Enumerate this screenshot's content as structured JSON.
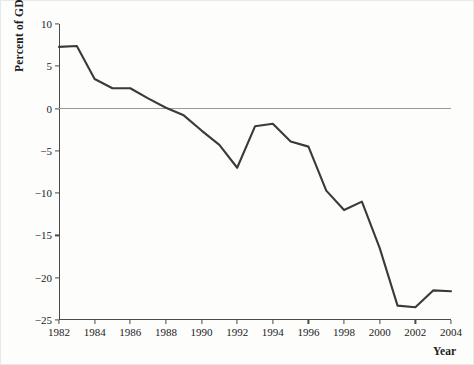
{
  "chart_data": {
    "type": "line",
    "title": "",
    "xlabel": "Year",
    "ylabel": "Percent of GDP",
    "xlim": [
      1982,
      2004
    ],
    "ylim": [
      -25,
      10
    ],
    "grid": false,
    "legend": "none",
    "zero_reference_line": true,
    "y_ticks": [
      10,
      5,
      0,
      -5,
      -10,
      -15,
      -20,
      -25
    ],
    "y_tick_labels": [
      "10",
      "5",
      "0",
      "−5",
      "−10",
      "−15",
      "−20",
      "−25"
    ],
    "x_ticks": [
      1982,
      1984,
      1986,
      1988,
      1990,
      1992,
      1994,
      1996,
      1998,
      2000,
      2002,
      2004
    ],
    "x_tick_labels": [
      "1982",
      "1984",
      "1986",
      "1988",
      "1990",
      "1992",
      "1994",
      "1996",
      "1998",
      "2000",
      "2002",
      "2004"
    ],
    "x": [
      1982,
      1983,
      1984,
      1985,
      1986,
      1987,
      1988,
      1989,
      1990,
      1991,
      1992,
      1993,
      1994,
      1995,
      1996,
      1997,
      1998,
      1999,
      2000,
      2001,
      2002,
      2003,
      2004
    ],
    "values": [
      7.3,
      7.4,
      3.5,
      2.4,
      2.4,
      1.2,
      0.1,
      -0.8,
      -2.6,
      -4.3,
      -7.0,
      -2.1,
      -1.8,
      -3.9,
      -4.5,
      -9.7,
      -12.0,
      -11.0,
      -16.5,
      -23.3,
      -23.5,
      -21.5,
      -21.6
    ],
    "series": [
      {
        "name": "Percent of GDP",
        "color": "#3a3a3a",
        "values": [
          7.3,
          7.4,
          3.5,
          2.4,
          2.4,
          1.2,
          0.1,
          -0.8,
          -2.6,
          -4.3,
          -7.0,
          -2.1,
          -1.8,
          -3.9,
          -4.5,
          -9.7,
          -12.0,
          -11.0,
          -16.5,
          -23.3,
          -23.5,
          -21.5,
          -21.6
        ]
      }
    ],
    "colors": {
      "line": "#3a3a3a",
      "axis": "#4a4a4a",
      "zero_line": "#999999",
      "text": "#1b1b1b",
      "background": "#fdfdfc"
    }
  }
}
